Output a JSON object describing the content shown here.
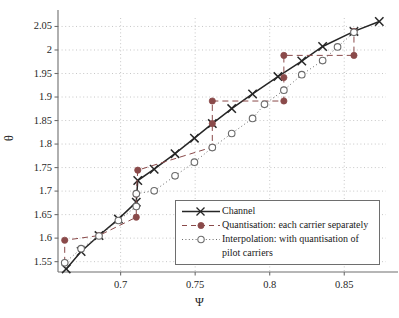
{
  "chart_data": {
    "type": "line",
    "title": "",
    "xlabel": "Ψ",
    "ylabel": "θ",
    "xlim": [
      0.658,
      0.878
    ],
    "ylim": [
      1.528,
      2.068
    ],
    "xticks": [
      0.7,
      0.75,
      0.8,
      0.85
    ],
    "xtick_labels": [
      "0.7",
      "0.75",
      "0.8",
      "0.85"
    ],
    "yticks": [
      1.55,
      1.6,
      1.65,
      1.7,
      1.75,
      1.8,
      1.85,
      1.9,
      1.95,
      2.0,
      2.05
    ],
    "ytick_labels": [
      "1.55",
      "1.6",
      "1.65",
      "1.7",
      "1.75",
      "1.8",
      "1.85",
      "1.9",
      "1.95",
      "2",
      "2.05"
    ],
    "grid": true,
    "grid_style": "dotted",
    "legend_position": "lower right",
    "series": [
      {
        "name": "Channel",
        "marker": "x",
        "linestyle": "solid",
        "color": "#262626",
        "points": [
          [
            0.6635,
            1.5345
          ],
          [
            0.6735,
            1.5715
          ],
          [
            0.6855,
            1.6055
          ],
          [
            0.6985,
            1.6405
          ],
          [
            0.7105,
            1.6765
          ],
          [
            0.7115,
            1.7225
          ],
          [
            0.7225,
            1.7465
          ],
          [
            0.7365,
            1.7795
          ],
          [
            0.7495,
            1.8125
          ],
          [
            0.7615,
            1.8435
          ],
          [
            0.7745,
            1.8755
          ],
          [
            0.7885,
            1.9065
          ],
          [
            0.8055,
            1.9435
          ],
          [
            0.8215,
            1.9765
          ],
          [
            0.8355,
            2.0075
          ],
          [
            0.8565,
            2.0395
          ],
          [
            0.8735,
            2.0605
          ]
        ]
      },
      {
        "name": "Quantisation: each carrier separately",
        "marker": "filled-circle",
        "linestyle": "dashed",
        "color": "#8a4a4a",
        "points": [
          [
            0.6625,
            1.5475
          ],
          [
            0.6625,
            1.5955
          ],
          [
            0.6855,
            1.6055
          ],
          [
            0.7105,
            1.6445
          ],
          [
            0.7105,
            1.6935
          ],
          [
            0.7115,
            1.7445
          ],
          [
            0.7615,
            1.7935
          ],
          [
            0.7615,
            1.8435
          ],
          [
            0.7615,
            1.8915
          ],
          [
            0.8095,
            1.8915
          ],
          [
            0.8095,
            1.9415
          ],
          [
            0.8095,
            1.9885
          ],
          [
            0.8565,
            1.9885
          ],
          [
            0.8565,
            2.0395
          ]
        ]
      },
      {
        "name": "Interpolation: with quantisation of pilot carriers",
        "marker": "open-circle",
        "linestyle": "dotted",
        "color": "#6b6b6b",
        "points": [
          [
            0.6625,
            1.5475
          ],
          [
            0.6735,
            1.5775
          ],
          [
            0.6855,
            1.6045
          ],
          [
            0.6985,
            1.6375
          ],
          [
            0.7105,
            1.6675
          ],
          [
            0.7105,
            1.6945
          ],
          [
            0.7225,
            1.7005
          ],
          [
            0.7365,
            1.7325
          ],
          [
            0.7495,
            1.7615
          ],
          [
            0.7615,
            1.7925
          ],
          [
            0.7745,
            1.8225
          ],
          [
            0.7885,
            1.8545
          ],
          [
            0.7965,
            1.8845
          ],
          [
            0.8095,
            1.9145
          ],
          [
            0.8215,
            1.9475
          ],
          [
            0.8355,
            1.9775
          ],
          [
            0.8455,
            2.0065
          ],
          [
            0.8565,
            2.0375
          ]
        ]
      }
    ]
  },
  "legend": {
    "entries": [
      {
        "label": "Channel"
      },
      {
        "label": "Quantisation: each carrier separately"
      },
      {
        "label": "Interpolation: with quantisation of"
      },
      {
        "label": "pilot carriers"
      }
    ]
  },
  "colors": {
    "channel": "#262626",
    "quantisation": "#8a4a4a",
    "interpolation": "#6b6b6b",
    "grid": "#b9b9b9",
    "axis": "#6e6e6e",
    "text": "#1a1a1a"
  }
}
